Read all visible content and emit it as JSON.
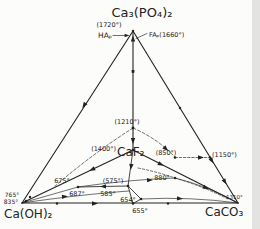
{
  "figure": {
    "type": "ternary-phase-diagram",
    "system": {
      "apex_top": "Ca₃(PO₄)₂",
      "corner_left": "Ca(OH)₂",
      "corner_right": "CaCO₃",
      "interior_compound": "CaF₂"
    },
    "phase_labels": {
      "hap": "HAₚ",
      "fap": "FAₚ(1660°)"
    },
    "temperatures": {
      "apex": "(1720°)",
      "t1210": "(1210°)",
      "t1400": "(1400°)",
      "t850": "(850°)",
      "t1150": "(1150°)",
      "t880": "880°",
      "t675": "675°",
      "t575": "(575°)",
      "t687": "687°",
      "t585": "585°",
      "t654": "654°",
      "t655": "655°",
      "t765": "765°",
      "t835": "835°",
      "t1310": "1310°"
    },
    "colors": {
      "ink": "#222222",
      "background": "#fcfcfb"
    }
  }
}
